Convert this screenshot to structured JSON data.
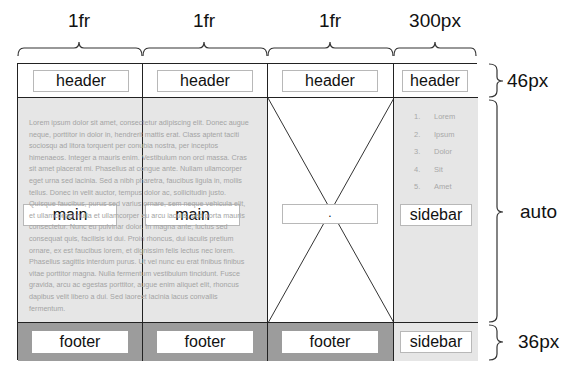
{
  "columns": [
    {
      "size_label": "1fr"
    },
    {
      "size_label": "1fr"
    },
    {
      "size_label": "1fr"
    },
    {
      "size_label": "300px"
    }
  ],
  "rows": [
    {
      "size_label": "46px"
    },
    {
      "size_label": "auto"
    },
    {
      "size_label": "36px"
    }
  ],
  "header_row": {
    "cells": [
      "header",
      "header",
      "header",
      "header"
    ]
  },
  "main_row": {
    "cells": [
      "main",
      "main",
      ".",
      "sidebar"
    ],
    "lorem_text": "Lorem ipsum dolor sit amet, consectetur adipiscing elit. Donec augue neque, porttitor in dolor in, hendrerit mattis erat. Class aptent taciti sociosqu ad litora torquent per conubia nostra, per inceptos himenaeos. Integer a mauris enim. Vestibulum non orci massa. Cras sit amet placerat mi. Phasellus at congue ante. Nullam ullamcorper eget urna sed lacinia. Sed a nibh pharetra, faucibus ligula in, mollis tellus. Donec in velit auctor, tempus dolor ac, sollicitudin justo. Quisque faucibus, purus sed varius ornare, sem neque vehicula elit, et ullamcorper nulla et ullamcorper eu arcu iaculis, sed porta mauris consectetur. Nunc eu pulvinar dolor. In magna ante, luctus sed consequat quis, facilisis id dui. Proin rhoncus, dui iaculis pretium ornare, ex est faucibus lorem, et dignissim felis lectus nec lorem. Phasellus sagittis interdum purus. Ut vel nunc eu erat finibus finibus vitae porttitor magna. Nulla fermentum vestibulum tincidunt. Fusce gravida, arcu ac egestas porttitor, augue enim aliquet elit, rhoncus dapibus velit libero a dui. Sed laoreet lacinia lacus convallis fermentum.",
    "sidebar_list": [
      {
        "num": "1.",
        "text": "Lorem"
      },
      {
        "num": "2.",
        "text": "Ipsum"
      },
      {
        "num": "3.",
        "text": "Dolor"
      },
      {
        "num": "4.",
        "text": "Sit"
      },
      {
        "num": "5.",
        "text": "Amet"
      }
    ]
  },
  "footer_row": {
    "cells": [
      "footer",
      "footer",
      "footer",
      "sidebar"
    ]
  },
  "colors": {
    "grid_line": "#222222",
    "main_bg": "#e6e6e6",
    "footer_bg": "#9c9c9c",
    "tag_border": "#b8b8b8"
  }
}
